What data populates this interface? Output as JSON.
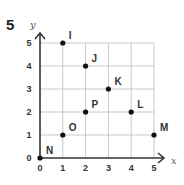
{
  "question_number": "5",
  "chart_data": {
    "type": "scatter",
    "title": "",
    "xlabel": "x",
    "ylabel": "y",
    "xlim": [
      0,
      5
    ],
    "ylim": [
      0,
      5
    ],
    "grid": true,
    "x_ticks": [
      "0",
      "1",
      "2",
      "3",
      "4",
      "5"
    ],
    "y_ticks": [
      "0",
      "1",
      "2",
      "3",
      "4",
      "5"
    ],
    "points": [
      {
        "label": "I",
        "x": 1,
        "y": 5
      },
      {
        "label": "J",
        "x": 2,
        "y": 4
      },
      {
        "label": "K",
        "x": 3,
        "y": 3
      },
      {
        "label": "L",
        "x": 4,
        "y": 2
      },
      {
        "label": "M",
        "x": 5,
        "y": 1
      },
      {
        "label": "N",
        "x": 0,
        "y": 0
      },
      {
        "label": "O",
        "x": 1,
        "y": 1
      },
      {
        "label": "P",
        "x": 2,
        "y": 2
      }
    ]
  },
  "colors": {
    "grid": "#bbbbbb",
    "axis": "#333333",
    "point": "#111111"
  }
}
